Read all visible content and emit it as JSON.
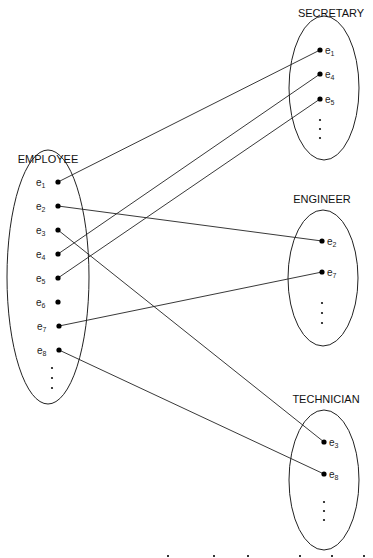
{
  "diagram": {
    "type": "set-mapping",
    "sets": [
      {
        "id": "employee",
        "label": "EMPLOYEE",
        "label_pos": [
          48,
          163
        ],
        "ellipse": {
          "cx": 48,
          "cy": 277,
          "rx": 41,
          "ry": 127
        },
        "label_side": "left",
        "elements": [
          {
            "name": "e",
            "sub": "1",
            "x": 58,
            "y": 182
          },
          {
            "name": "e",
            "sub": "2",
            "x": 58,
            "y": 206
          },
          {
            "name": "e",
            "sub": "3",
            "x": 58,
            "y": 230
          },
          {
            "name": "e",
            "sub": "4",
            "x": 58,
            "y": 254
          },
          {
            "name": "e",
            "sub": "5",
            "x": 58,
            "y": 278
          },
          {
            "name": "e",
            "sub": "6",
            "x": 58,
            "y": 302
          },
          {
            "name": "e",
            "sub": "7",
            "x": 59,
            "y": 326
          },
          {
            "name": "e",
            "sub": "8",
            "x": 59,
            "y": 350
          }
        ],
        "ellipsis": [
          {
            "x": 52,
            "y": 368
          },
          {
            "x": 52,
            "y": 378
          },
          {
            "x": 52,
            "y": 388
          }
        ]
      },
      {
        "id": "secretary",
        "label": "SECRETARY",
        "label_pos": [
          331,
          17
        ],
        "ellipse": {
          "cx": 324,
          "cy": 88,
          "rx": 35,
          "ry": 72
        },
        "label_side": "right",
        "elements": [
          {
            "name": "e",
            "sub": "1",
            "x": 320,
            "y": 50
          },
          {
            "name": "e",
            "sub": "4",
            "x": 320,
            "y": 74
          },
          {
            "name": "e",
            "sub": "5",
            "x": 320,
            "y": 99
          }
        ],
        "ellipsis": [
          {
            "x": 320,
            "y": 120
          },
          {
            "x": 320,
            "y": 129
          },
          {
            "x": 320,
            "y": 138
          }
        ]
      },
      {
        "id": "engineer",
        "label": "ENGINEER",
        "label_pos": [
          322,
          203
        ],
        "ellipse": {
          "cx": 323,
          "cy": 278,
          "rx": 35,
          "ry": 68
        },
        "label_side": "right",
        "elements": [
          {
            "name": "e",
            "sub": "2",
            "x": 322,
            "y": 241
          },
          {
            "name": "e",
            "sub": "7",
            "x": 322,
            "y": 272
          }
        ],
        "ellipsis": [
          {
            "x": 322,
            "y": 303
          },
          {
            "x": 322,
            "y": 313
          },
          {
            "x": 322,
            "y": 323
          }
        ]
      },
      {
        "id": "technician",
        "label": "TECHNICIAN",
        "label_pos": [
          326,
          403
        ],
        "ellipse": {
          "cx": 324,
          "cy": 480,
          "rx": 35,
          "ry": 70
        },
        "label_side": "right",
        "elements": [
          {
            "name": "e",
            "sub": "3",
            "x": 324,
            "y": 442
          },
          {
            "name": "e",
            "sub": "8",
            "x": 324,
            "y": 474
          }
        ],
        "ellipsis": [
          {
            "x": 324,
            "y": 502
          },
          {
            "x": 324,
            "y": 511
          },
          {
            "x": 324,
            "y": 520
          }
        ]
      }
    ],
    "mappings": [
      {
        "from": "employee.e1",
        "to": "secretary.e1",
        "x1": 58,
        "y1": 182,
        "x2": 320,
        "y2": 50
      },
      {
        "from": "employee.e2",
        "to": "engineer.e2",
        "x1": 58,
        "y1": 206,
        "x2": 322,
        "y2": 241
      },
      {
        "from": "employee.e3",
        "to": "technician.e3",
        "x1": 58,
        "y1": 230,
        "x2": 324,
        "y2": 442
      },
      {
        "from": "employee.e4",
        "to": "secretary.e4",
        "x1": 58,
        "y1": 254,
        "x2": 320,
        "y2": 74
      },
      {
        "from": "employee.e5",
        "to": "secretary.e5",
        "x1": 58,
        "y1": 278,
        "x2": 320,
        "y2": 99
      },
      {
        "from": "employee.e7",
        "to": "engineer.e7",
        "x1": 59,
        "y1": 326,
        "x2": 322,
        "y2": 272
      },
      {
        "from": "employee.e8",
        "to": "technician.e8",
        "x1": 59,
        "y1": 350,
        "x2": 324,
        "y2": 474
      }
    ],
    "cutoff_marks": [
      {
        "x": 168,
        "y": 557
      },
      {
        "x": 214,
        "y": 557
      },
      {
        "x": 248,
        "y": 557
      },
      {
        "x": 300,
        "y": 557
      },
      {
        "x": 332,
        "y": 557
      },
      {
        "x": 364,
        "y": 557
      }
    ]
  }
}
